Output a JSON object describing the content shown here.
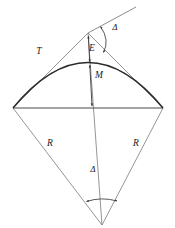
{
  "diagram": {
    "background_color": "#ffffff",
    "line_color_thin": "#6e6e6e",
    "line_color_curve": "#2a2a2a",
    "line_color_chord": "#4a4a4a",
    "label_color": "#1a1a1a",
    "labels": {
      "tangent": "T",
      "external": "E",
      "middle_ordinate": "M",
      "radius_left": "R",
      "radius_right": "R",
      "delta_top": "Δ",
      "delta_bottom": "Δ"
    },
    "label_positions": {
      "tangent": {
        "x": 39,
        "y": 54
      },
      "external": {
        "x": 92,
        "y": 51
      },
      "middle_ordinate": {
        "x": 99,
        "y": 78
      },
      "radius_left": {
        "x": 50,
        "y": 146
      },
      "radius_right": {
        "x": 136,
        "y": 146
      },
      "delta_top": {
        "x": 115,
        "y": 30
      },
      "delta_bottom": {
        "x": 93,
        "y": 172
      }
    },
    "vertices": {
      "pi_apex": {
        "x": 88,
        "y": 33,
        "name": "point-of-intersection"
      },
      "pc_left": {
        "x": 13,
        "y": 108,
        "name": "point-of-curvature"
      },
      "pt_right": {
        "x": 163,
        "y": 108,
        "name": "point-of-tangency"
      },
      "center_bottom": {
        "x": 102,
        "y": 225,
        "name": "curve-center"
      },
      "arc_midpoint": {
        "x": 90,
        "y": 63,
        "name": "curve-midpoint"
      },
      "chord_midpoint": {
        "x": 92,
        "y": 108,
        "name": "chord-midpoint"
      },
      "tangent_extension_end": {
        "x": 136,
        "y": 7,
        "name": "back-tangent-extension"
      }
    },
    "geometry_notes": {
      "arc_control": {
        "x": 88,
        "y": 18
      },
      "delta_arc_top": "double-headed arc between tangent extension and forward tangent at apex",
      "delta_arc_bottom": "double-headed arc between the two radii at the curve center"
    }
  }
}
